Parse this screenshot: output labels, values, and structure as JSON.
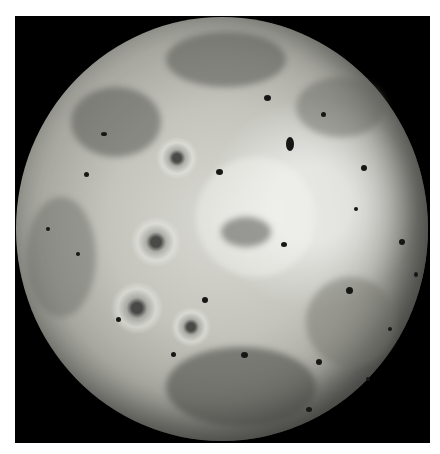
{
  "image": {
    "subject": "Jupiter's moon Io, full disk grayscale view",
    "background_color": "#000000",
    "page_color": "#ffffff",
    "surface_tones": [
      "#d9d9d3",
      "#c4c4bd",
      "#a9a9a2",
      "#7c7c76",
      "#3d3d3a"
    ],
    "features": {
      "volcanic_hotspots": "numerous small dark spots scattered across the disk",
      "haloed_vents": "several dark vents surrounded by bright/dark rings on the left hemisphere",
      "dark_flows": "dark irregular patches in the northern and southern regions"
    },
    "caption_note": "caption text at bottom is cropped and illegible"
  }
}
